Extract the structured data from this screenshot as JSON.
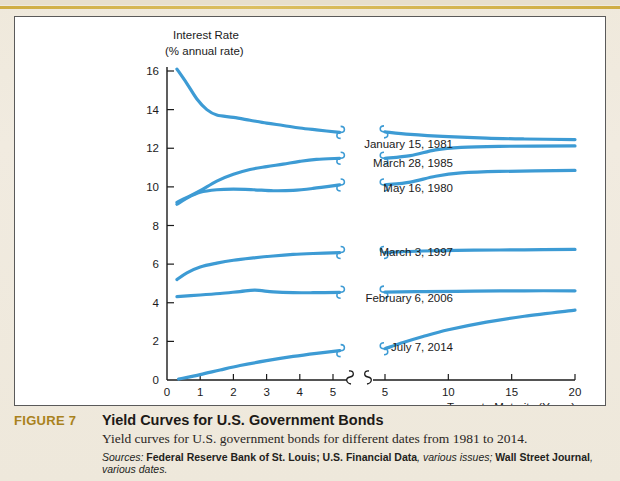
{
  "figure": {
    "number_label": "FIGURE 7",
    "title": "Yield Curves for U.S. Government Bonds",
    "subtitle": "Yield curves for U.S. government bonds for different dates from 1981 to 2014.",
    "sources_prefix": "Sources:",
    "source_1_bold": "Federal Reserve Bank of St. Louis; U.S. Financial Data",
    "source_1_italic": ", various issues;",
    "source_2_bold": "Wall Street Journal",
    "source_2_italic": ", various dates.",
    "accent_color": "#a9821d",
    "line_color": "#3d9bd4"
  },
  "chart_data": {
    "type": "line",
    "title": "",
    "ylabel_line1": "Interest Rate",
    "ylabel_line2": "(% annual rate)",
    "xlabel": "Terms to Maturity (Years)",
    "ylim": [
      0,
      16
    ],
    "yticks": [
      0,
      2,
      4,
      6,
      8,
      10,
      12,
      14,
      16
    ],
    "xticks_left": [
      0,
      1,
      2,
      3,
      4,
      5
    ],
    "xticks_right": [
      5,
      10,
      15,
      20
    ],
    "axis_break": true,
    "grid": false,
    "legend_position": "inline-right-of-curves",
    "series": [
      {
        "name": "January 15, 1981",
        "label": "January 15, 1981",
        "left": [
          [
            0.3,
            16.1
          ],
          [
            0.6,
            15.35
          ],
          [
            0.9,
            14.55
          ],
          [
            1.2,
            14.0
          ],
          [
            1.5,
            13.72
          ],
          [
            2.0,
            13.6
          ],
          [
            2.5,
            13.45
          ],
          [
            3.0,
            13.3
          ],
          [
            3.5,
            13.18
          ],
          [
            4.0,
            13.05
          ],
          [
            4.5,
            12.95
          ],
          [
            5.2,
            12.82
          ]
        ],
        "right": [
          [
            5.0,
            12.85
          ],
          [
            7.0,
            12.72
          ],
          [
            10.0,
            12.6
          ],
          [
            13.0,
            12.52
          ],
          [
            16.0,
            12.48
          ],
          [
            20.0,
            12.45
          ]
        ]
      },
      {
        "name": "March 28, 1985",
        "label": "March 28, 1985",
        "left": [
          [
            0.3,
            9.2
          ],
          [
            0.6,
            9.45
          ],
          [
            1.0,
            9.8
          ],
          [
            1.5,
            10.3
          ],
          [
            2.0,
            10.65
          ],
          [
            2.5,
            10.9
          ],
          [
            3.0,
            11.05
          ],
          [
            3.5,
            11.18
          ],
          [
            4.0,
            11.32
          ],
          [
            4.5,
            11.42
          ],
          [
            5.2,
            11.48
          ]
        ],
        "right": [
          [
            5.0,
            11.48
          ],
          [
            7.0,
            11.62
          ],
          [
            9.0,
            11.92
          ],
          [
            11.0,
            12.05
          ],
          [
            14.0,
            12.1
          ],
          [
            20.0,
            12.12
          ]
        ]
      },
      {
        "name": "May 16, 1980",
        "label": "May 16, 1980",
        "left": [
          [
            0.3,
            9.1
          ],
          [
            0.6,
            9.42
          ],
          [
            1.0,
            9.72
          ],
          [
            1.5,
            9.85
          ],
          [
            2.0,
            9.88
          ],
          [
            2.6,
            9.85
          ],
          [
            3.2,
            9.8
          ],
          [
            3.8,
            9.82
          ],
          [
            4.4,
            9.92
          ],
          [
            5.2,
            10.1
          ]
        ],
        "right": [
          [
            5.0,
            10.1
          ],
          [
            7.0,
            10.25
          ],
          [
            9.0,
            10.55
          ],
          [
            11.0,
            10.72
          ],
          [
            14.0,
            10.8
          ],
          [
            20.0,
            10.85
          ]
        ]
      },
      {
        "name": "March 3, 1997",
        "label": "March 3, 1997",
        "left": [
          [
            0.3,
            5.2
          ],
          [
            0.6,
            5.55
          ],
          [
            1.0,
            5.85
          ],
          [
            1.5,
            6.05
          ],
          [
            2.0,
            6.2
          ],
          [
            2.6,
            6.32
          ],
          [
            3.2,
            6.42
          ],
          [
            3.8,
            6.5
          ],
          [
            4.4,
            6.55
          ],
          [
            5.2,
            6.6
          ]
        ],
        "right": [
          [
            5.0,
            6.6
          ],
          [
            8.0,
            6.68
          ],
          [
            12.0,
            6.72
          ],
          [
            16.0,
            6.74
          ],
          [
            20.0,
            6.76
          ]
        ]
      },
      {
        "name": "February 6, 2006",
        "label": "February 6, 2006",
        "left": [
          [
            0.3,
            4.32
          ],
          [
            1.0,
            4.4
          ],
          [
            1.6,
            4.48
          ],
          [
            2.2,
            4.58
          ],
          [
            2.65,
            4.65
          ],
          [
            3.2,
            4.56
          ],
          [
            3.8,
            4.52
          ],
          [
            4.4,
            4.52
          ],
          [
            5.2,
            4.54
          ]
        ],
        "right": [
          [
            5.0,
            4.55
          ],
          [
            8.0,
            4.58
          ],
          [
            12.0,
            4.6
          ],
          [
            16.0,
            4.62
          ],
          [
            20.0,
            4.62
          ]
        ]
      },
      {
        "name": "July 7, 2014",
        "label": "July 7, 2014",
        "left": [
          [
            0.35,
            0.05
          ],
          [
            1.0,
            0.28
          ],
          [
            1.6,
            0.52
          ],
          [
            2.2,
            0.75
          ],
          [
            3.0,
            1.0
          ],
          [
            3.8,
            1.22
          ],
          [
            4.5,
            1.38
          ],
          [
            5.2,
            1.52
          ]
        ],
        "right": [
          [
            5.0,
            1.62
          ],
          [
            6.5,
            1.95
          ],
          [
            8.0,
            2.25
          ],
          [
            10.0,
            2.6
          ],
          [
            13.0,
            3.0
          ],
          [
            16.0,
            3.3
          ],
          [
            20.0,
            3.62
          ]
        ]
      }
    ],
    "labels": [
      {
        "text": "January 15, 1981",
        "x": 438,
        "y": 131
      },
      {
        "text": "March 28, 1985",
        "x": 438,
        "y": 150
      },
      {
        "text": "May 16, 1980",
        "x": 438,
        "y": 175
      },
      {
        "text": "March 3, 1997",
        "x": 438,
        "y": 239
      },
      {
        "text": "February 6, 2006",
        "x": 438,
        "y": 285
      },
      {
        "text": "July 7, 2014",
        "x": 438,
        "y": 334
      }
    ]
  }
}
